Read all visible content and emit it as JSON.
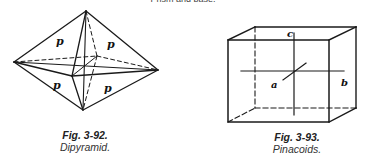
{
  "header": {
    "partial_text": "Prism and base."
  },
  "figures": [
    {
      "number": "Fig. 3-92.",
      "title": "Dipyramid.",
      "face_labels": [
        "p",
        "p",
        "p",
        "p"
      ]
    },
    {
      "number": "Fig. 3-93.",
      "title": "Pinacoids.",
      "axis_labels": {
        "a": "a",
        "b": "b",
        "c": "c"
      }
    }
  ]
}
